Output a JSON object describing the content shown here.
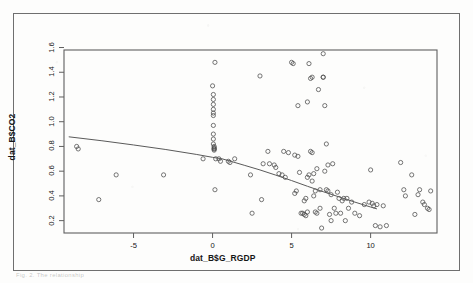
{
  "figure": {
    "caption_fragment": "Fig. 2.   The relationship",
    "frame_color": "#6f6f6f",
    "background_color": "#fdfdfc"
  },
  "chart_data": {
    "type": "scatter",
    "title": "",
    "xlabel": "dat_B$G_RGDP",
    "ylabel": "dat_B$CO2",
    "xlim": [
      -9.4,
      14.2
    ],
    "ylim": [
      0.1,
      1.58
    ],
    "grid": false,
    "legend": null,
    "marker": "open-circle",
    "marker_color": "#4a4a4a",
    "xticks": [
      -5,
      0,
      5,
      10
    ],
    "xtick_labels": [
      "-5",
      "0",
      "5",
      "10"
    ],
    "yticks": [
      0.2,
      0.4,
      0.6,
      0.8,
      1.0,
      1.2,
      1.4,
      1.6
    ],
    "ytick_labels": [
      "0.2",
      "0.4",
      "0.6",
      "0.8",
      "1.0",
      "1.2",
      "1.4",
      "1.6"
    ],
    "trend_line": {
      "type": "lowess",
      "color": "#5a5a5a",
      "points": [
        [
          -9.1,
          0.878
        ],
        [
          -7.0,
          0.846
        ],
        [
          -5.0,
          0.812
        ],
        [
          -3.0,
          0.776
        ],
        [
          -1.0,
          0.735
        ],
        [
          0.0,
          0.712
        ],
        [
          0.6,
          0.7
        ],
        [
          1.2,
          0.678
        ],
        [
          2.0,
          0.648
        ],
        [
          3.0,
          0.61
        ],
        [
          4.0,
          0.568
        ],
        [
          5.0,
          0.524
        ],
        [
          6.0,
          0.478
        ],
        [
          7.0,
          0.434
        ],
        [
          8.0,
          0.392
        ],
        [
          9.0,
          0.35
        ],
        [
          10.0,
          0.31
        ],
        [
          10.4,
          0.295
        ]
      ]
    },
    "x": [
      -8.6,
      -8.5,
      -7.2,
      -6.1,
      -3.1,
      -0.6,
      0.0,
      0.05,
      0.05,
      0.05,
      0.05,
      0.05,
      0.05,
      0.05,
      0.05,
      0.05,
      0.05,
      0.1,
      0.1,
      0.1,
      0.1,
      0.1,
      0.15,
      0.15,
      0.2,
      0.4,
      0.5,
      1.0,
      1.1,
      1.4,
      2.4,
      2.5,
      3.0,
      3.1,
      3.2,
      3.5,
      3.6,
      3.9,
      4.0,
      4.2,
      4.4,
      4.5,
      4.6,
      4.8,
      5.0,
      5.1,
      5.2,
      5.2,
      5.3,
      5.4,
      5.4,
      5.5,
      5.6,
      5.7,
      5.8,
      5.8,
      5.9,
      5.9,
      6.0,
      6.0,
      6.0,
      6.1,
      6.1,
      6.2,
      6.2,
      6.3,
      6.3,
      6.3,
      6.4,
      6.4,
      6.5,
      6.5,
      6.6,
      6.6,
      6.7,
      6.8,
      6.8,
      6.9,
      7.0,
      7.0,
      7.0,
      7.1,
      7.1,
      7.2,
      7.2,
      7.3,
      7.3,
      7.4,
      7.5,
      7.5,
      7.6,
      7.7,
      7.8,
      7.9,
      8.0,
      8.1,
      8.2,
      8.3,
      8.4,
      8.5,
      8.6,
      8.8,
      9.0,
      9.3,
      9.6,
      9.9,
      10.0,
      10.1,
      10.2,
      10.3,
      10.4,
      10.6,
      10.8,
      11.0,
      11.9,
      12.1,
      12.2,
      12.6,
      12.8,
      13.0,
      13.1,
      13.3,
      13.4,
      13.6,
      13.7,
      13.8
    ],
    "y": [
      0.8,
      0.78,
      0.37,
      0.57,
      0.57,
      0.7,
      1.29,
      1.22,
      1.18,
      1.14,
      1.1,
      1.07,
      1.05,
      0.97,
      0.9,
      0.86,
      0.82,
      0.8,
      0.79,
      0.78,
      0.78,
      0.77,
      1.48,
      0.45,
      0.7,
      0.7,
      0.68,
      0.68,
      0.67,
      0.7,
      0.57,
      0.26,
      1.37,
      0.37,
      0.66,
      0.76,
      0.66,
      0.65,
      0.63,
      0.58,
      0.57,
      0.76,
      0.55,
      0.75,
      1.48,
      1.47,
      0.73,
      0.42,
      0.44,
      1.13,
      0.72,
      0.59,
      0.26,
      0.26,
      0.25,
      0.36,
      0.24,
      0.38,
      1.16,
      0.55,
      0.27,
      1.47,
      0.57,
      1.35,
      0.76,
      1.36,
      0.75,
      0.52,
      0.58,
      0.4,
      0.44,
      0.27,
      0.62,
      0.26,
      1.26,
      0.45,
      0.3,
      0.14,
      1.55,
      1.36,
      1.36,
      1.13,
      0.6,
      0.82,
      0.45,
      0.65,
      0.44,
      0.25,
      0.41,
      0.2,
      0.66,
      0.3,
      0.26,
      0.43,
      0.38,
      0.26,
      0.36,
      0.38,
      0.2,
      0.38,
      0.3,
      0.35,
      0.26,
      0.24,
      0.33,
      0.35,
      0.61,
      0.34,
      0.32,
      0.16,
      0.33,
      0.15,
      0.32,
      0.16,
      0.67,
      0.45,
      0.4,
      0.57,
      0.25,
      0.41,
      0.45,
      0.35,
      0.33,
      0.3,
      0.29,
      0.44
    ]
  }
}
